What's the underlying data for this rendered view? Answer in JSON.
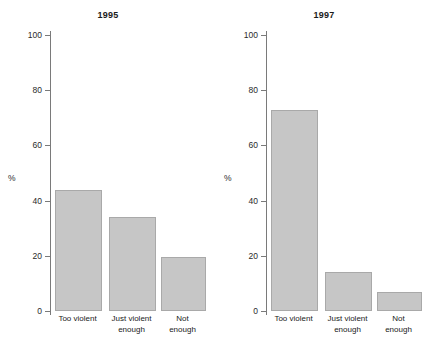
{
  "chart_data": [
    {
      "type": "bar",
      "title": "1995",
      "categories": [
        "Too violent",
        "Just violent\nenough",
        "Not\nenough"
      ],
      "values": [
        44,
        34,
        19.5
      ],
      "xlabel": "",
      "ylabel": "%",
      "ylim": [
        0,
        100
      ],
      "yticks": [
        0,
        20,
        40,
        60,
        80,
        100
      ],
      "grid": false,
      "legend": "none",
      "bar_color": "#c6c6c6",
      "bar_edge_color": "#a9a9a9"
    },
    {
      "type": "bar",
      "title": "1997",
      "categories": [
        "Too violent",
        "Just violent\nenough",
        "Not\nenough"
      ],
      "values": [
        73,
        14,
        7
      ],
      "xlabel": "",
      "ylabel": "%",
      "ylim": [
        0,
        100
      ],
      "yticks": [
        0,
        20,
        40,
        60,
        80,
        100
      ],
      "grid": false,
      "legend": "none",
      "bar_color": "#c6c6c6",
      "bar_edge_color": "#a9a9a9"
    }
  ],
  "panels": [
    {
      "title": "1995",
      "ylabel": "%",
      "ticks": [
        "0",
        "20",
        "40",
        "60",
        "80",
        "100"
      ],
      "bars": [
        {
          "label": "Too violent",
          "value": 44
        },
        {
          "label": "Just violent\nenough",
          "value": 34
        },
        {
          "label": "Not\nenough",
          "value": 19.5
        }
      ]
    },
    {
      "title": "1997",
      "ylabel": "%",
      "ticks": [
        "0",
        "20",
        "40",
        "60",
        "80",
        "100"
      ],
      "bars": [
        {
          "label": "Too violent",
          "value": 73
        },
        {
          "label": "Just violent\nenough",
          "value": 14
        },
        {
          "label": "Not\nenough",
          "value": 7
        }
      ]
    }
  ]
}
